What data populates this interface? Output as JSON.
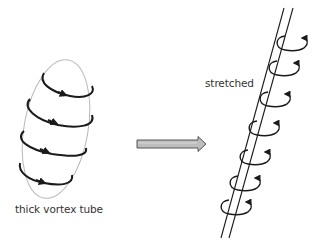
{
  "diagram": {
    "left": {
      "label": "thick vortex tube",
      "ring_count": 4,
      "outline_color": "#b3b3b3",
      "ring_color": "#1a1a1a"
    },
    "transition": {
      "arrow_fill": "#bdbdbd",
      "arrow_stroke": "#555555",
      "direction": "right"
    },
    "right": {
      "label": "stretched",
      "ring_count": 7,
      "tube_color": "#1a1a1a",
      "ring_color": "#1a1a1a"
    }
  }
}
